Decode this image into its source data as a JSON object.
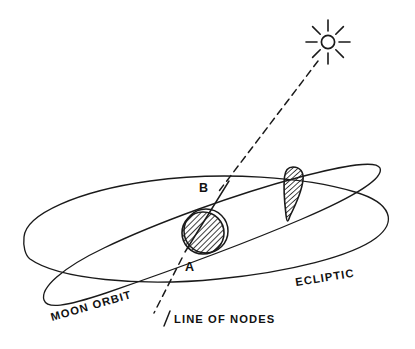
{
  "diagram": {
    "background_color": "#ffffff",
    "ink_color": "#1a1a1a",
    "width": 415,
    "height": 349,
    "labels": {
      "moon_orbit": "MOON ORBIT",
      "ecliptic": "ECLIPTIC",
      "line_of_nodes": "LINE OF NODES",
      "node_a": "A",
      "node_b": "B"
    },
    "elements": {
      "sun": {
        "name": "sun-icon",
        "center_x": 328,
        "center_y": 42,
        "radius": 7,
        "ray_count": 8,
        "ray_inner": 11,
        "ray_outer": 21
      },
      "earth": {
        "name": "earth-shape",
        "center_x": 204,
        "center_y": 232,
        "radius": 22,
        "hatched": true,
        "hatch_angle_deg": 45
      },
      "shadow_cone": {
        "name": "umbra-cone-shape",
        "apex_x": 288,
        "apex_y": 221,
        "top_y": 167,
        "top_left_x": 284,
        "top_right_x": 303,
        "hatched": true
      },
      "ecliptic_plane": {
        "name": "ecliptic-orbit-ellipse",
        "center_x": 208,
        "center_y": 240,
        "rx": 185,
        "ry": 48,
        "rotation_deg": -2
      },
      "moon_orbit_plane": {
        "name": "moon-orbit-ellipse",
        "center_x": 210,
        "center_y": 238,
        "rx": 176,
        "ry": 46,
        "rotation_deg": -17
      },
      "sun_ray_line": {
        "name": "sun-ray-dashed-line",
        "from_x": 318,
        "from_y": 60,
        "to_x": 219,
        "to_y": 190,
        "style": "dashed"
      },
      "line_of_nodes": {
        "name": "line-of-nodes-axis",
        "solid_from_x": 228,
        "solid_from_y": 183,
        "solid_to_x": 186,
        "solid_to_y": 251,
        "dashed_from_x": 183,
        "dashed_from_y": 257,
        "dashed_to_x": 155,
        "dashed_to_y": 312,
        "style": "solid-then-dashed"
      }
    },
    "label_positions": {
      "moon_orbit": {
        "x": 52,
        "y": 318,
        "rotation_deg": -16
      },
      "ecliptic": {
        "x": 298,
        "y": 285,
        "rotation_deg": -9
      },
      "line_of_nodes": {
        "x": 173,
        "y": 321,
        "rotation_deg": 0
      },
      "line_of_nodes_tick": {
        "x1": 164,
        "y1": 325,
        "x2": 170,
        "y2": 311
      },
      "node_a": {
        "x": 187,
        "y": 267
      },
      "node_b": {
        "x": 201,
        "y": 189
      }
    }
  }
}
